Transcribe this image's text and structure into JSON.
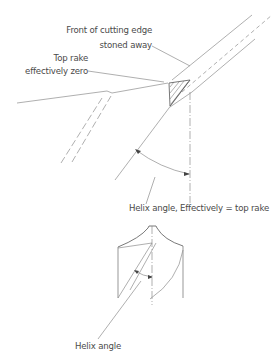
{
  "figure": {
    "type": "technical-drawing"
  },
  "labels": {
    "front_edge_line1": "Front of cutting edge",
    "front_edge_line2": "stoned away",
    "top_rake_line1": "Top rake",
    "top_rake_line2": "effectively zero",
    "helix_effective": "Helix angle, Effectively = top rake",
    "helix_angle": "Helix angle"
  },
  "colors": {
    "line": "#8a8a8a",
    "text": "#4a4a4a",
    "hatch": "#555555"
  }
}
